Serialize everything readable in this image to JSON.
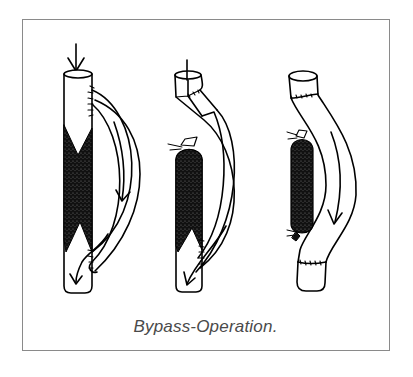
{
  "figure": {
    "caption": "Bypass-Operation.",
    "panels": [
      {
        "name": "stage-1",
        "description": "Blocked vessel with bypass graft sutured above and below the blockage; arrows show blood flow diverted through the graft"
      },
      {
        "name": "stage-2",
        "description": "Vessel tied off above blockage; graft sewn to upper vessel; flow through graft into lower vessel"
      },
      {
        "name": "stage-3",
        "description": "Blocked segment tied off at both ends; graft replaces the segment with sutured ends"
      }
    ]
  },
  "colors": {
    "line": "#000000",
    "fill_blockage": "#111111",
    "frame": "#8a8a8a",
    "caption": "#4a4a4a",
    "background": "#ffffff"
  }
}
